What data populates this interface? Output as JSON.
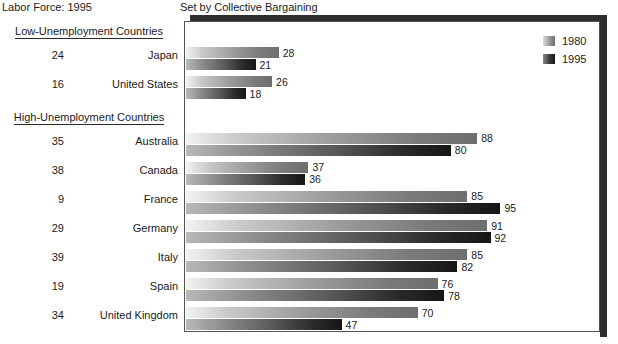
{
  "captions": {
    "left": "Labor Force: 1995",
    "right": "Set by Collective Bargaining"
  },
  "groups": [
    {
      "label": "Low-Unemployment Countries"
    },
    {
      "label": "High-Unemployment Countries"
    }
  ],
  "legend": {
    "items": [
      {
        "label": "1980",
        "color": "#6e6e6e",
        "swatch": "sw-1980"
      },
      {
        "label": "1995",
        "color": "#161616",
        "swatch": "sw-1995"
      }
    ]
  },
  "chart_data": {
    "type": "bar",
    "orientation": "horizontal",
    "title": "Set by Collective Bargaining",
    "subtitle": "Labor Force: 1995",
    "xlabel": "",
    "ylabel": "",
    "xlim": [
      0,
      100
    ],
    "grid": false,
    "legend_position": "top-right",
    "categories": [
      "Japan",
      "United States",
      "Australia",
      "Canada",
      "France",
      "Germany",
      "Italy",
      "Spain",
      "United Kingdom"
    ],
    "series": [
      {
        "name": "1980",
        "values": [
          28,
          26,
          88,
          37,
          85,
          91,
          85,
          76,
          70
        ]
      },
      {
        "name": "1995",
        "values": [
          21,
          18,
          80,
          36,
          95,
          92,
          82,
          78,
          47
        ]
      }
    ],
    "row_annotation_label": "Labor Force: 1995",
    "row_annotations": [
      24,
      16,
      35,
      38,
      9,
      29,
      39,
      19,
      34
    ],
    "groups": [
      {
        "label": "Low-Unemployment Countries",
        "categories": [
          "Japan",
          "United States"
        ]
      },
      {
        "label": "High-Unemployment Countries",
        "categories": [
          "Australia",
          "Canada",
          "France",
          "Germany",
          "Italy",
          "Spain",
          "United Kingdom"
        ]
      }
    ]
  }
}
